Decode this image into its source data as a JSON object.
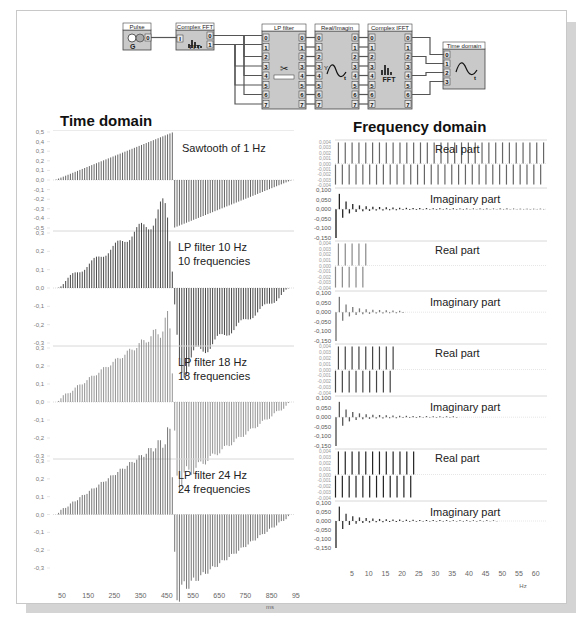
{
  "flow_diagram": {
    "blocks": [
      {
        "id": "pulse",
        "title": "Pulse",
        "outputs": [
          "0"
        ]
      },
      {
        "id": "complex_fft",
        "title": "Complex FFT",
        "inputs": [
          "I"
        ],
        "outputs": [
          "0",
          "1"
        ],
        "label": "FFT"
      },
      {
        "id": "lp_filter",
        "title": "LP filter",
        "inputs": [
          "0",
          "1",
          "2",
          "3",
          "4",
          "5",
          "6",
          "7"
        ],
        "outputs": [
          "0",
          "1",
          "2",
          "3",
          "4",
          "5",
          "6",
          "7"
        ]
      },
      {
        "id": "real_imagin",
        "title": "Real/Imagin",
        "inputs": [
          "0",
          "1",
          "2",
          "3",
          "4",
          "5",
          "6",
          "7"
        ],
        "outputs": [
          "0",
          "1",
          "2",
          "3",
          "4",
          "5",
          "6",
          "7"
        ]
      },
      {
        "id": "complex_ifft",
        "title": "Complex IFFT",
        "inputs": [
          "0",
          "1",
          "2",
          "3",
          "4",
          "5",
          "6",
          "7"
        ],
        "outputs": [
          "0",
          "1",
          "2",
          "3",
          "4",
          "5",
          "6",
          "7"
        ],
        "label": "FFT"
      },
      {
        "id": "time_domain",
        "title": "Time domain",
        "inputs": [
          "0",
          "1",
          "2",
          "3"
        ]
      }
    ]
  },
  "headings": {
    "time": "Time domain",
    "freq": "Frequency domain"
  },
  "chart_data": [
    {
      "type": "bar",
      "title": "Time domain",
      "xlabel": "ms",
      "x_ticks": [
        "50",
        "150",
        "250",
        "350",
        "450",
        "550",
        "650",
        "750",
        "850",
        "950"
      ],
      "xlim": [
        0,
        1000
      ],
      "panels": [
        {
          "annotation": [
            "Sawtooth of 1 Hz"
          ],
          "ylim": [
            -0.5,
            0.5
          ],
          "y_ticks": [
            "0,5",
            "0,4",
            "0,3",
            "0,2",
            "0,1",
            "0,0",
            "-0,1",
            "-0,2",
            "-0,3",
            "-0,4",
            "-0,5"
          ],
          "signal": "sawtooth",
          "harmonics": 0,
          "color": "#555555"
        },
        {
          "annotation": [
            "LP filter  10 Hz",
            "10 frequencies"
          ],
          "ylim": [
            -0.3,
            0.3
          ],
          "y_ticks": [
            "0,3",
            "0,2",
            "0,1",
            "0,0",
            "-0,1",
            "-0,2",
            "-0,3"
          ],
          "signal": "fourier",
          "harmonics": 10,
          "color": "#333333"
        },
        {
          "annotation": [
            "LP filter  18 Hz",
            "18 frequencies"
          ],
          "ylim": [
            -0.3,
            0.3
          ],
          "y_ticks": [
            "0,3",
            "0,2",
            "0,1",
            "0,0",
            "-0,1",
            "-0,2",
            "-0,3"
          ],
          "signal": "fourier",
          "harmonics": 18,
          "color": "#888888"
        },
        {
          "annotation": [
            "LP filter 24 Hz",
            "24 frequencies"
          ],
          "ylim": [
            -0.3,
            0.3
          ],
          "y_ticks": [
            "0,3",
            "0,2",
            "0,1",
            "0,0",
            "-0,1",
            "-0,2",
            "-0,3"
          ],
          "signal": "fourier",
          "harmonics": 24,
          "color": "#666666"
        }
      ]
    },
    {
      "type": "bar",
      "title": "Frequency domain",
      "xlabel": "Hz",
      "x_ticks": [
        "5",
        "10",
        "15",
        "20",
        "25",
        "30",
        "35",
        "40",
        "45",
        "50",
        "55",
        "60"
      ],
      "xlim": [
        0,
        62
      ],
      "panels": [
        {
          "label": "Real part",
          "kind": "real",
          "harmonics": 31,
          "ylim": [
            -0.004,
            0.004
          ],
          "y_ticks": [
            "0,004",
            "0,003",
            "0,002",
            "0,001",
            "0,000",
            "-0,001",
            "-0,002",
            "-0,003",
            "-0,004"
          ],
          "color": "#666666"
        },
        {
          "label": "Imaginary part",
          "kind": "imag",
          "harmonics": 31,
          "ylim": [
            -0.15,
            0.1
          ],
          "y_ticks": [
            "0,100",
            "0,050",
            "0,000",
            "-0,050",
            "-0,100",
            "-0,150"
          ],
          "color": "#222222"
        },
        {
          "label": "Real part",
          "kind": "real",
          "harmonics": 5,
          "ylim": [
            -0.004,
            0.004
          ],
          "y_ticks": [
            "0,004",
            "0,003",
            "0,002",
            "0,001",
            "0,000",
            "-0,001",
            "-0,002",
            "-0,003",
            "-0,004"
          ],
          "color": "#888888"
        },
        {
          "label": "Imaginary part",
          "kind": "imag",
          "harmonics": 10,
          "ylim": [
            -0.15,
            0.1
          ],
          "y_ticks": [
            "0,100",
            "0,050",
            "0,000",
            "-0,050",
            "-0,100",
            "-0,150"
          ],
          "color": "#777777"
        },
        {
          "label": "Real part",
          "kind": "real",
          "harmonics": 9,
          "ylim": [
            -0.004,
            0.004
          ],
          "y_ticks": [
            "0,004",
            "0,003",
            "0,002",
            "0,001",
            "0,000",
            "-0,001",
            "-0,002",
            "-0,003",
            "-0,004"
          ],
          "color": "#444444"
        },
        {
          "label": "Imaginary part",
          "kind": "imag",
          "harmonics": 18,
          "ylim": [
            -0.15,
            0.1
          ],
          "y_ticks": [
            "0,100",
            "0,050",
            "0,000",
            "-0,050",
            "-0,100",
            "-0,150"
          ],
          "color": "#555555"
        },
        {
          "label": "Real part",
          "kind": "real",
          "harmonics": 12,
          "ylim": [
            -0.004,
            0.004
          ],
          "y_ticks": [
            "0,004",
            "0,003",
            "0,002",
            "0,001",
            "0,000",
            "-0,001",
            "-0,002",
            "-0,003",
            "-0,004"
          ],
          "color": "#222222"
        },
        {
          "label": "Imaginary part",
          "kind": "imag",
          "harmonics": 24,
          "ylim": [
            -0.15,
            0.1
          ],
          "y_ticks": [
            "0,100",
            "0,050",
            "0,000",
            "-0,050",
            "-0,100",
            "-0,150"
          ],
          "color": "#333333"
        }
      ]
    }
  ]
}
